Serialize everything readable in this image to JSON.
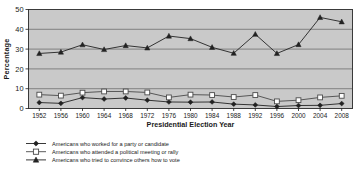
{
  "chart_data": {
    "type": "line",
    "title": "",
    "subtitle": "",
    "xlabel": "Presidential Election Year",
    "ylabel": "Percentage",
    "categories": [
      1952,
      1956,
      1960,
      1964,
      1968,
      1972,
      1976,
      1980,
      1984,
      1988,
      1992,
      1996,
      2000,
      2004,
      2008
    ],
    "xtick_labels": [
      "1952",
      "1956",
      "1960",
      "1964",
      "1968",
      "1972",
      "1976",
      "1980",
      "1984",
      "1988",
      "1992",
      "1996",
      "2000",
      "2004",
      "2008"
    ],
    "ytick_labels": [
      "0",
      "10",
      "20",
      "30",
      "40",
      "50"
    ],
    "yticks": [
      0,
      10,
      20,
      30,
      40,
      50
    ],
    "ylim": [
      0,
      50
    ],
    "grid": true,
    "grid_axis": "y",
    "legend_position": "below",
    "plot_background": "#c9c9c9",
    "series": [
      {
        "name": "Americans who worked for a party or candidate",
        "marker": "filled-diamond",
        "color": "#222222",
        "values": [
          3.0,
          2.6,
          5.5,
          4.8,
          5.3,
          4.2,
          3.3,
          3.2,
          3.3,
          2.2,
          1.8,
          1.0,
          1.5,
          1.6,
          2.5
        ]
      },
      {
        "name": "Americans who attended a political meeting or rally",
        "marker": "open-square",
        "color": "#4a4a4a",
        "values": [
          7.0,
          6.5,
          8.0,
          8.6,
          8.6,
          8.1,
          5.6,
          7.0,
          6.8,
          5.8,
          6.8,
          3.6,
          4.2,
          5.6,
          6.4
        ]
      },
      {
        "name": "Americans who tried to convince others how to vote",
        "marker": "filled-triangle",
        "color": "#222222",
        "values": [
          27.8,
          28.5,
          32.2,
          29.8,
          31.8,
          30.6,
          36.6,
          35.3,
          30.9,
          27.9,
          37.5,
          27.8,
          32.3,
          46.0,
          43.8
        ]
      }
    ]
  },
  "axes": {
    "y_title": "Percentage",
    "x_title": "Presidential Election Year"
  },
  "legend": {
    "items": [
      {
        "label": "Americans who worked for a party or candidate",
        "marker": "filled-diamond"
      },
      {
        "label": "Americans who attended a political meeting or rally",
        "marker": "open-square"
      },
      {
        "label": "Americans who tried to convince others how to vote",
        "marker": "filled-triangle"
      }
    ]
  }
}
